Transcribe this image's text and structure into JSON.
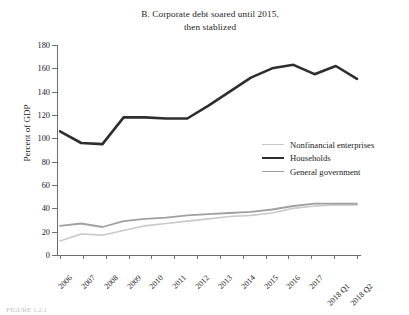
{
  "figure": {
    "panel_label": "B.",
    "title_line1": "B. Corporate debt soared until 2015,",
    "title_line2": "then stablized",
    "caption": "FIGURE 1.2.1"
  },
  "legend": {
    "position": "inside-right",
    "items": [
      {
        "label": "Nonfinancial enterprises",
        "color": "#c9c9c9",
        "width": 1.6
      },
      {
        "label": "Households",
        "color": "#2e2e2e",
        "width": 2.6
      },
      {
        "label": "General government",
        "color": "#a0a0a0",
        "width": 1.8
      }
    ]
  },
  "axes": {
    "ylabel": "Percent of GDP",
    "yticks": [
      0,
      20,
      40,
      60,
      80,
      100,
      120,
      140,
      160,
      180
    ],
    "ylim": [
      0,
      180
    ],
    "xlabel": "",
    "grid": false,
    "axis_color": "#6f6f6f"
  },
  "chart_data": {
    "type": "line",
    "title": "B. Corporate debt soared until 2015, then stablized",
    "xlabel": "",
    "ylabel": "Percent of GDP",
    "ylim": [
      0,
      180
    ],
    "grid": false,
    "legend_position": "inside-right",
    "categories": [
      "2006",
      "2007",
      "2008",
      "2009",
      "2010",
      "2011",
      "2012",
      "2013",
      "2014",
      "2015",
      "2016",
      "2017",
      "2018 Q1",
      "2018 Q2"
    ],
    "series": [
      {
        "name": "Households",
        "color": "#2e2e2e",
        "values": [
          106,
          96,
          95,
          118,
          118,
          117,
          117,
          128,
          140,
          152,
          160,
          163,
          155,
          162
        ]
      },
      {
        "name": "General government",
        "color": "#a0a0a0",
        "values": [
          25,
          27,
          24,
          29,
          31,
          32,
          34,
          35,
          36,
          37,
          39,
          42,
          44,
          44
        ]
      },
      {
        "name": "Nonfinancial enterprises",
        "color": "#c9c9c9",
        "values": [
          12,
          18,
          17,
          21,
          25,
          27,
          29,
          31,
          33,
          34,
          36,
          40,
          42,
          43
        ]
      }
    ],
    "series_tail": {
      "Households": [
        151
      ],
      "General government": [
        44
      ],
      "Nonfinancial enterprises": [
        43
      ]
    }
  }
}
